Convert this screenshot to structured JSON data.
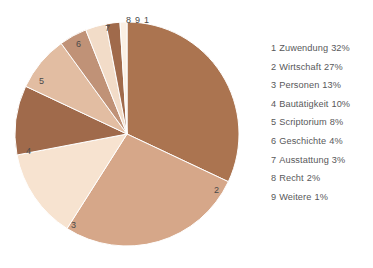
{
  "chart_data": {
    "type": "pie",
    "title": "",
    "subtitle": "",
    "xlabel": "",
    "ylabel": "",
    "legend_position": "right",
    "grid": false,
    "start_angle_deg": 0,
    "direction": "clockwise",
    "units": "%",
    "categories": [
      "Zuwendung",
      "Wirtschaft",
      "Personen",
      "Bautätigkeit",
      "Scriptorium",
      "Geschichte",
      "Ausstattung",
      "Recht",
      "Weitere"
    ],
    "values": [
      32,
      27,
      13,
      10,
      8,
      4,
      3,
      2,
      1
    ],
    "colors": [
      "#ab7450",
      "#d6a789",
      "#f7e3d0",
      "#a06a4b",
      "#e2bda2",
      "#c09277",
      "#f2dcc8",
      "#a06a4b",
      "#fbf0e4"
    ],
    "slice_labels": [
      "1",
      "2",
      "3",
      "4",
      "5",
      "6",
      "7",
      "8",
      "9"
    ]
  },
  "legend": {
    "entries": [
      {
        "index": "1",
        "label": "Zuwendung",
        "value": "32%"
      },
      {
        "index": "2",
        "label": "Wirtschaft",
        "value": "27%"
      },
      {
        "index": "3",
        "label": "Personen",
        "value": "13%"
      },
      {
        "index": "4",
        "label": "Bautätigkeit",
        "value": "10%"
      },
      {
        "index": "5",
        "label": "Scriptorium",
        "value": "8%"
      },
      {
        "index": "6",
        "label": "Geschichte",
        "value": "4%"
      },
      {
        "index": "7",
        "label": "Ausstattung",
        "value": "3%"
      },
      {
        "index": "8",
        "label": "Recht",
        "value": "2%"
      },
      {
        "index": "9",
        "label": "Weitere",
        "value": "1%"
      }
    ]
  },
  "slice_markers": [
    {
      "id": "1",
      "label": "1"
    },
    {
      "id": "2",
      "label": "2"
    },
    {
      "id": "3",
      "label": "3"
    },
    {
      "id": "4",
      "label": "4"
    },
    {
      "id": "5",
      "label": "5"
    },
    {
      "id": "6",
      "label": "6"
    },
    {
      "id": "7",
      "label": "7"
    },
    {
      "id": "8",
      "label": "8"
    },
    {
      "id": "9",
      "label": "9"
    }
  ]
}
